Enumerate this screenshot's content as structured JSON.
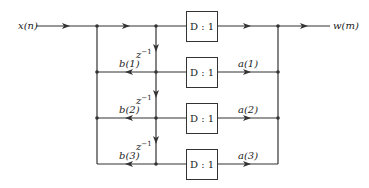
{
  "diagram": {
    "input_label": "x(n)",
    "output_label": "w(m)",
    "delay_label": "z",
    "delay_exp": "−1",
    "boxes": [
      {
        "label": "D : 1"
      },
      {
        "label": "D : 1"
      },
      {
        "label": "D : 1"
      },
      {
        "label": "D : 1"
      }
    ],
    "feedback_coeffs": [
      "b(1)",
      "b(2)",
      "b(3)"
    ],
    "feedforward_coeffs": [
      "a(1)",
      "a(2)",
      "a(3)"
    ],
    "line_color": "#333333"
  }
}
